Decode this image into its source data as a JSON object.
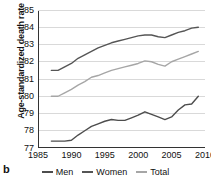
{
  "panel": {
    "label": "b"
  },
  "chart_data": {
    "type": "line",
    "title": "",
    "xlabel": "",
    "ylabel": "Age-standardized death rate",
    "xlim": [
      1985,
      2010
    ],
    "ylim": [
      77,
      85
    ],
    "xticks": [
      1985,
      1990,
      1995,
      2000,
      2005,
      2010
    ],
    "yticks": [
      77,
      78,
      79,
      80,
      81,
      82,
      83,
      84,
      85
    ],
    "grid": "horizontal",
    "legend_position": "bottom",
    "x": [
      1987,
      1988,
      1989,
      1990,
      1991,
      1992,
      1993,
      1994,
      1995,
      1996,
      1997,
      1998,
      1999,
      2000,
      2001,
      2002,
      2003,
      2004,
      2005,
      2006,
      2007,
      2008,
      2009
    ],
    "series": [
      {
        "name": "Women",
        "color": "#555555",
        "values": [
          81.5,
          81.5,
          81.7,
          81.9,
          82.2,
          82.4,
          82.6,
          82.8,
          82.95,
          83.1,
          83.2,
          83.3,
          83.4,
          83.5,
          83.55,
          83.55,
          83.45,
          83.4,
          83.55,
          83.7,
          83.8,
          83.95,
          84.0
        ]
      },
      {
        "name": "Total",
        "color": "#a6a6a6",
        "values": [
          80.0,
          80.0,
          80.2,
          80.4,
          80.65,
          80.85,
          81.1,
          81.2,
          81.35,
          81.5,
          81.6,
          81.7,
          81.8,
          81.9,
          82.05,
          82.0,
          81.85,
          81.75,
          82.0,
          82.15,
          82.3,
          82.45,
          82.6
        ]
      },
      {
        "name": "Men",
        "color": "#4d4d4d",
        "values": [
          77.4,
          77.4,
          77.4,
          77.45,
          77.75,
          78.0,
          78.25,
          78.4,
          78.55,
          78.65,
          78.6,
          78.6,
          78.75,
          78.9,
          79.1,
          78.95,
          78.8,
          78.65,
          78.8,
          79.2,
          79.5,
          79.55,
          80.0
        ]
      }
    ],
    "legend": [
      {
        "label": "Men",
        "color": "#4d4d4d"
      },
      {
        "label": "Women",
        "color": "#555555"
      },
      {
        "label": "Total",
        "color": "#a6a6a6"
      }
    ],
    "axis_color": "#333333",
    "grid_color": "#d9d9d9"
  }
}
